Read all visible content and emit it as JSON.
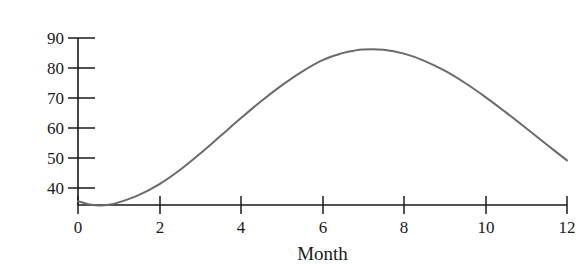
{
  "chart_data": {
    "type": "line",
    "title": "",
    "xlabel": "Month",
    "ylabel": "Normal high temperature",
    "xlim": [
      0,
      12
    ],
    "ylim": [
      34.3,
      90
    ],
    "xticks": [
      0,
      2,
      4,
      6,
      8,
      10,
      12
    ],
    "yticks": [
      40,
      50,
      60,
      70,
      80,
      90
    ],
    "xtick_labels": [
      "0",
      "2",
      "4",
      "6",
      "8",
      "10",
      "12"
    ],
    "ytick_labels": [
      "40",
      "50",
      "60",
      "70",
      "80",
      "90"
    ],
    "grid": false,
    "legend": null,
    "series": [
      {
        "name": "Normal high temperature",
        "color": "#6b6b6b",
        "line_width": 2,
        "x": [
          0,
          0.25,
          0.5,
          0.75,
          1,
          1.5,
          2,
          2.5,
          3,
          3.5,
          4,
          4.5,
          5,
          5.5,
          6,
          6.4,
          6.75,
          7,
          7.5,
          8,
          8.5,
          9,
          9.5,
          10,
          10.5,
          11,
          11.5,
          12
        ],
        "y": [
          35.6,
          34.6,
          34.2,
          34.4,
          35.2,
          37.7,
          41.3,
          46.0,
          51.5,
          57.4,
          63.3,
          69.0,
          74.2,
          78.8,
          82.6,
          84.6,
          85.7,
          86.2,
          86.1,
          84.8,
          82.4,
          79.1,
          75.0,
          70.3,
          65.2,
          59.9,
          54.5,
          49.2
        ]
      }
    ],
    "axis_color": "#1a1a1a",
    "curve_description": "Smooth sinusoid-like curve: minimum near month 0.5 at about 34, rising to a peak of about 88 near month 6.5, then falling back to about 35 at month 12."
  },
  "figure": {
    "background": "#ffffff",
    "y_axis_label": "Normal high temperature",
    "x_axis_label": "Month"
  }
}
